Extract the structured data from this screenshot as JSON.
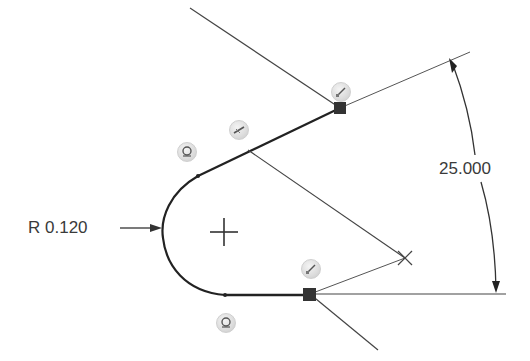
{
  "sketch": {
    "dimensions": {
      "angle": {
        "label": "25.000"
      },
      "radius": {
        "label": "R 0.120"
      }
    },
    "relation_glyphs": [
      {
        "id": "coincident-top",
        "type": "coincident",
        "x": 340,
        "y": 91
      },
      {
        "id": "parallel-tangent",
        "type": "perpendicular",
        "x": 238,
        "y": 129
      },
      {
        "id": "tangent-upper",
        "type": "tangent",
        "x": 186,
        "y": 151
      },
      {
        "id": "coincident-bottom",
        "type": "coincident",
        "x": 310,
        "y": 268
      },
      {
        "id": "tangent-lower",
        "type": "tangent",
        "x": 225,
        "y": 322
      }
    ],
    "colors": {
      "geometry": "#222222",
      "construction": "#444444",
      "dimension": "#3a3a3a",
      "glyph_bg": "#dcdcdc"
    }
  }
}
